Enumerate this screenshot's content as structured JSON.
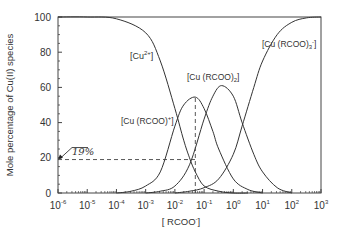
{
  "chart_data": {
    "type": "line",
    "title": "",
    "xlabel": "[ RCOO⁻]",
    "ylabel": "Mole percentage of Cu(II) species",
    "xscale": "log",
    "xlim": [
      1e-06,
      1000.0
    ],
    "ylim": [
      0,
      100
    ],
    "x_tick_labels": [
      "10⁻⁶",
      "10⁻⁵",
      "10⁻⁴",
      "10⁻³",
      "10⁻²",
      "10⁻¹",
      "10⁰",
      "10¹",
      "10²",
      "10³"
    ],
    "y_tick_labels": [
      "0",
      "20",
      "40",
      "60",
      "80",
      "100"
    ],
    "grid": false,
    "legend": "inline labels",
    "series": [
      {
        "name": "[Cu²⁺]",
        "log10_x": [
          -6,
          -5,
          -4,
          -3,
          -2.5,
          -2,
          -1.7,
          -1.5,
          -1.3,
          -1,
          -0.5,
          0,
          0.5
        ],
        "values": [
          100,
          100,
          99,
          91,
          75,
          48,
          30,
          20,
          12,
          4,
          1,
          0,
          0
        ]
      },
      {
        "name": "[Cu (RCOO)⁺]",
        "log10_x": [
          -4,
          -3.5,
          -3,
          -2.5,
          -2,
          -1.7,
          -1.3,
          -1,
          -0.7,
          -0.5,
          0,
          0.5,
          1
        ],
        "values": [
          0,
          1,
          4,
          12,
          38,
          50,
          54.5,
          48,
          35,
          25,
          8,
          2,
          0
        ]
      },
      {
        "name": "[Cu (RCOO)₂]",
        "log10_x": [
          -3,
          -2.5,
          -2,
          -1.5,
          -1,
          -0.7,
          -0.4,
          0,
          0.3,
          0.7,
          1,
          1.5,
          2
        ],
        "values": [
          0,
          1,
          4,
          16,
          42,
          55,
          61,
          55,
          40,
          22,
          12,
          3,
          0
        ]
      },
      {
        "name": "[Cu (RCOO)₃⁻]",
        "log10_x": [
          -2,
          -1.5,
          -1,
          -0.5,
          0,
          0.3,
          0.7,
          1,
          1.5,
          2,
          2.5,
          3
        ],
        "values": [
          0,
          1,
          3,
          8,
          22,
          38,
          60,
          75,
          90,
          97,
          99.5,
          100
        ]
      }
    ],
    "annotations": [
      {
        "text": "19%",
        "x": 1e-06,
        "y": 19,
        "type": "arrow-label"
      },
      {
        "type": "dashed-line",
        "from": [
          1e-06,
          19
        ],
        "to": [
          0.05,
          19
        ]
      },
      {
        "type": "dashed-line",
        "from": [
          0.05,
          0
        ],
        "to": [
          0.05,
          54.5
        ]
      }
    ]
  },
  "labels": {
    "cu2": "[Cu",
    "cu2_sup": "2+",
    "cu2_end": "]",
    "curcoo": "[Cu (RCOO)",
    "curcoo_sup": "+",
    "curcoo_end": "]",
    "curcoo2": "[Cu (RCOO)",
    "curcoo2_sub": "2",
    "curcoo2_end": "]",
    "curcoo3": "[Cu (RCOO)",
    "curcoo3_sub": "3",
    "curcoo3_sup": "-",
    "curcoo3_end": "]",
    "annotation": "19%",
    "xlabel_pre": "[ RCOO",
    "xlabel_sup": "-",
    "xlabel_end": "]",
    "ylabel": "Mole percentage of Cu(II) species"
  }
}
